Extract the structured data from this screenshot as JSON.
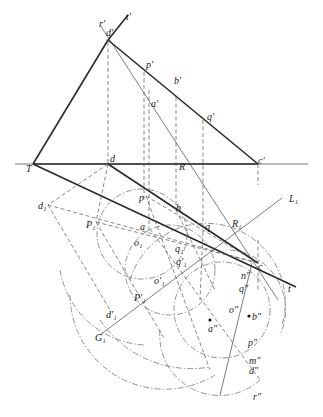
{
  "diagram": {
    "type": "descriptive-geometry",
    "labels": {
      "r_prime": "r′",
      "t_prime": "t′",
      "d_prime": "d′",
      "p_prime": "p′",
      "b_prime": "b′",
      "a_prime": "a′",
      "q_prime": "q′",
      "c_prime": "c′",
      "T": "T",
      "d": "d",
      "R": "R",
      "d1": "d₁",
      "p": "p",
      "b": "b",
      "P1": "P₁",
      "R1": "R₁",
      "L1": "L₁",
      "a": "a",
      "o1": "o₁",
      "q1": "q₁",
      "q": "q",
      "q1_prime": "q′₁",
      "c": "c",
      "t": "t",
      "o1_prime": "o′₁",
      "n2": "n″",
      "P1_prime": "P′₁",
      "q2": "q″",
      "G1": "G₁",
      "d1_prime": "d′₁",
      "o2": "o″",
      "b2": "b″",
      "a2": "a″",
      "p2": "p″",
      "m2": "m″",
      "d2": "d″",
      "r2": "r″"
    }
  }
}
